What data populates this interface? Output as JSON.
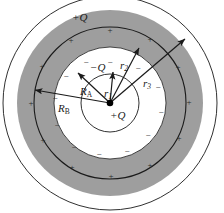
{
  "figure": {
    "colors": {
      "shell_fill": "#9e9e9e",
      "stroke": "#1a1a1a",
      "background": "#ffffff",
      "text": "#1a1a1a"
    },
    "center": {
      "x": 110,
      "y": 103
    },
    "circles": [
      {
        "name": "inner-sphere",
        "r": 29,
        "fill": "#ffffff"
      },
      {
        "name": "shell-inner-surface",
        "r": 56,
        "fill": "#9e9e9e"
      },
      {
        "name": "shell-mid-line",
        "r": 76,
        "fill": "none"
      },
      {
        "name": "shell-outer-surface",
        "r": 93,
        "fill": "none"
      },
      {
        "name": "outer-boundary",
        "r": 107,
        "fill": "none"
      }
    ],
    "labels": {
      "outer_charge": "+Q",
      "shell_charge": "−Q",
      "point_charge": "+Q",
      "r1": "r",
      "r1_sub": "1",
      "r2": "r",
      "r2_sub": "2",
      "r3": "r",
      "r3_sub": "3",
      "RA": "R",
      "RA_sub": "A",
      "RB": "R",
      "RB_sub": "B"
    },
    "arrows": [
      {
        "name": "r1-arrow",
        "label": "r1",
        "to_x": 113,
        "to_y": 70
      },
      {
        "name": "r2-arrow",
        "label": "r2",
        "to_x": 140,
        "to_y": 46
      },
      {
        "name": "r3-arrow",
        "label": "r3",
        "to_x": 186,
        "to_y": 37
      },
      {
        "name": "RA-arrow",
        "label": "RA",
        "to_x": 77,
        "to_y": 72
      },
      {
        "name": "RB-arrow",
        "label": "RB",
        "to_x": 33,
        "to_y": 90
      }
    ],
    "plus_signs_count": 12,
    "minus_signs_count": 12
  }
}
